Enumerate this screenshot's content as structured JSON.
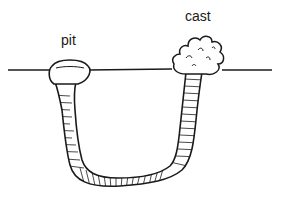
{
  "diagram": {
    "labels": {
      "pit": "pit",
      "cast": "cast"
    },
    "colors": {
      "ink": "#1a1a1a",
      "background": "#ffffff"
    }
  }
}
